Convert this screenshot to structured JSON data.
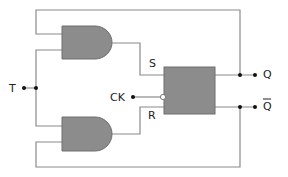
{
  "diagram": {
    "colors": {
      "wire": "#8a8a8a",
      "gate_fill": "#8c8c8c",
      "gate_stroke": "#6e6e6e",
      "dot": "#111111",
      "text": "#222222"
    },
    "labels": {
      "t_input": "T",
      "clock_input": "CK",
      "set_input": "S",
      "reset_input": "R",
      "output_q": "Q",
      "output_q_bar": "Q"
    },
    "components": [
      {
        "id": "and-gate-top",
        "type": "AND"
      },
      {
        "id": "and-gate-bottom",
        "type": "AND"
      },
      {
        "id": "sr-flip-flop",
        "type": "SR flip-flop",
        "inputs": [
          "S",
          "CK",
          "R"
        ],
        "outputs": [
          "Q",
          "Q-bar"
        ]
      }
    ]
  }
}
